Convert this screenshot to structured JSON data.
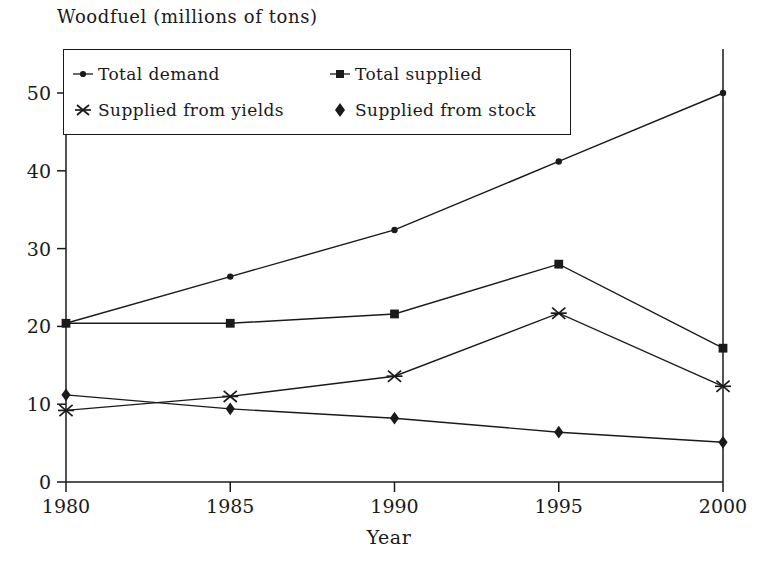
{
  "chart_data": {
    "type": "line",
    "title": "Woodfuel (millions of tons)",
    "xlabel": "Year",
    "ylabel": "",
    "x": [
      1980,
      1985,
      1990,
      1995,
      2000
    ],
    "xtick_labels": [
      "1980",
      "1985",
      "1990",
      "1995",
      "2000"
    ],
    "ytick_labels": [
      "0",
      "10",
      "20",
      "30",
      "40",
      "50"
    ],
    "yticks": [
      0,
      10,
      20,
      30,
      40,
      50
    ],
    "xlim": [
      1980,
      2000
    ],
    "ylim": [
      0,
      55
    ],
    "grid": false,
    "legend_position": "top-left-inside",
    "series": [
      {
        "name": "Total demand",
        "marker": "dot",
        "values": [
          20.4,
          26.4,
          32.4,
          41.2,
          50.0
        ]
      },
      {
        "name": "Total supplied",
        "marker": "square",
        "values": [
          20.4,
          20.4,
          21.6,
          28.0,
          17.2
        ]
      },
      {
        "name": "Supplied from yields",
        "marker": "asterisk",
        "values": [
          9.2,
          11.0,
          13.6,
          21.7,
          12.3
        ]
      },
      {
        "name": "Supplied from stock",
        "marker": "diamond",
        "values": [
          11.2,
          9.4,
          8.2,
          6.4,
          5.1
        ]
      }
    ],
    "colors": {
      "line": "#1a1a1a",
      "axis": "#1a1a1a",
      "background": "#ffffff"
    }
  },
  "legend": {
    "entries": [
      {
        "label": "Total demand",
        "marker": "dot-marker"
      },
      {
        "label": "Total supplied",
        "marker": "square-marker"
      },
      {
        "label": "Supplied from yields",
        "marker": "asterisk-marker"
      },
      {
        "label": "Supplied from stock",
        "marker": "diamond-marker"
      }
    ]
  }
}
